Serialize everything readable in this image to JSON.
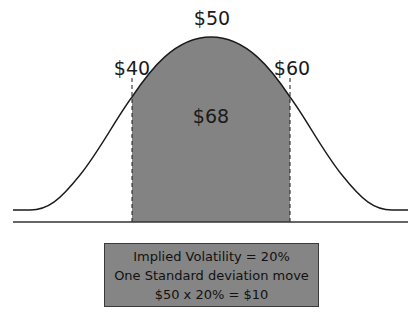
{
  "diagram": {
    "type": "normal-distribution",
    "mean_label": "$50",
    "lower_label": "$40",
    "upper_label": "$60",
    "area_label": "$68",
    "fill_color": "#838383",
    "line_color": "#1a1a1a"
  },
  "info_box": {
    "lines": [
      "Implied Volatility = 20%",
      "One Standard deviation move",
      "$50 x 20% = $10"
    ]
  }
}
